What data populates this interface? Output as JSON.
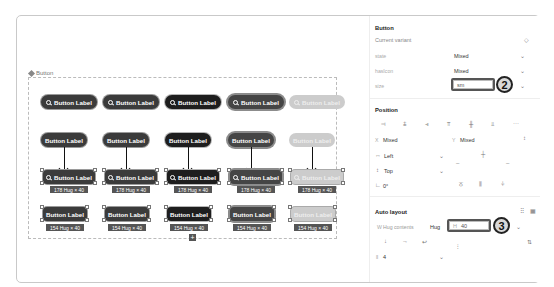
{
  "canvas": {
    "frame_label": "Button",
    "rows": [
      {
        "kind": "icon-buttons",
        "buttons": [
          {
            "label": "Button Label",
            "icon": "search-icon",
            "variant": "default"
          },
          {
            "label": "Button Label",
            "icon": "search-icon",
            "variant": "default"
          },
          {
            "label": "Button Label",
            "icon": "search-icon",
            "variant": "dark"
          },
          {
            "label": "Button Label",
            "icon": "search-icon",
            "variant": "mid"
          },
          {
            "label": "Button Label",
            "icon": "search-icon",
            "variant": "disabled"
          }
        ]
      },
      {
        "kind": "text-buttons",
        "buttons": [
          {
            "label": "Button Label",
            "variant": "default"
          },
          {
            "label": "Button Label",
            "variant": "default"
          },
          {
            "label": "Button Label",
            "variant": "dark"
          },
          {
            "label": "Button Label",
            "variant": "mid"
          },
          {
            "label": "Button Label",
            "variant": "disabled"
          }
        ]
      },
      {
        "kind": "selected-icon-buttons",
        "buttons": [
          {
            "label": "Button Label",
            "icon": "search-icon",
            "variant": "default",
            "dimension": "178 Hug × 40"
          },
          {
            "label": "Button Label",
            "icon": "search-icon",
            "variant": "default",
            "dimension": "178 Hug × 40"
          },
          {
            "label": "Button Label",
            "icon": "search-icon",
            "variant": "dark",
            "dimension": "178 Hug × 40"
          },
          {
            "label": "Button Label",
            "icon": "search-icon",
            "variant": "mid",
            "dimension": "178 Hug × 40"
          },
          {
            "label": "Button Label",
            "icon": "search-icon",
            "variant": "disabled",
            "dimension": "178 Hug × 40"
          }
        ]
      },
      {
        "kind": "selected-text-buttons",
        "buttons": [
          {
            "label": "Button Label",
            "variant": "default",
            "dimension": "154 Hug × 40"
          },
          {
            "label": "Button Label",
            "variant": "default",
            "dimension": "154 Hug × 40"
          },
          {
            "label": "Button Label",
            "variant": "dark",
            "dimension": "154 Hug × 40"
          },
          {
            "label": "Button Label",
            "variant": "mid",
            "dimension": "154 Hug × 40"
          },
          {
            "label": "Button Label",
            "variant": "disabled",
            "dimension": "154 Hug × 40"
          }
        ]
      }
    ],
    "add_icon": "+"
  },
  "panel": {
    "component": {
      "title": "Button",
      "subtitle": "Current variant",
      "props": [
        {
          "label": "state",
          "value": "Mixed"
        },
        {
          "label": "hasIcon",
          "value": "Mixed"
        },
        {
          "label": "size",
          "value": "sm"
        }
      ],
      "callout_number": "2"
    },
    "position": {
      "title": "Position",
      "x_label": "X",
      "x_value": "Mixed",
      "y_label": "Y",
      "y_value": "Mixed",
      "h_constraint": "Left",
      "v_constraint": "Top",
      "rotation": "0°"
    },
    "auto_layout": {
      "title": "Auto layout",
      "width_label": "W",
      "width_value": "Hug contents",
      "width_mode": "Hug",
      "height_label": "H",
      "height_value": "40",
      "gap_value": "4",
      "callout_number": "3"
    }
  }
}
